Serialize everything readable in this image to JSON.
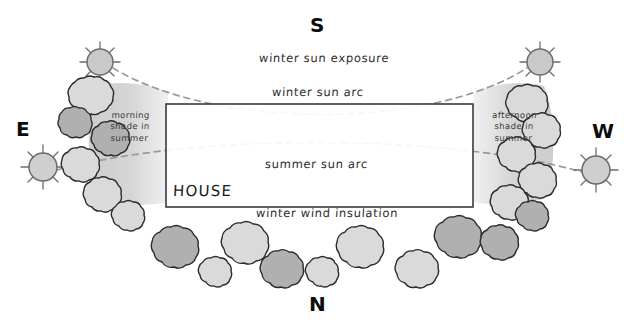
{
  "diagram": {
    "title_hidden": "Passive solar landscaping site plan",
    "compass": {
      "south": "S",
      "east": "E",
      "west": "W",
      "north": "N"
    },
    "labels": {
      "winter_sun_exposure": "winter sun exposure",
      "winter_sun_arc": "winter sun arc",
      "summer_sun_arc": "summer sun arc",
      "winter_wind_insulation": "winter wind insulation",
      "morning_shade": "morning\nshade in\nsummer",
      "morning_shade_line1": "morning",
      "morning_shade_line2": "shade in",
      "morning_shade_line3": "summer",
      "afternoon_shade_line1": "afternoon",
      "afternoon_shade_line2": "shade in",
      "afternoon_shade_line3": "summer",
      "house": "HOUSE"
    },
    "colors": {
      "background": "#ffffff",
      "outline": "#2b2b2b",
      "sun_fill": "#c9c9c9",
      "shrub_light": "#dadada",
      "shrub_medium": "#b0b0b0",
      "shade_fill": "#cfcfcf",
      "arc_dash": "#9a9a9a",
      "house_border": "#3a3a3a",
      "house_fill": "#ffffff",
      "compass_text": "#0d0d0d"
    },
    "house": {
      "x": 166,
      "y": 104,
      "width": 307,
      "height": 103
    },
    "suns": [
      {
        "name": "winter-sunrise-sun",
        "cx": 100,
        "cy": 62,
        "r": 13,
        "rays": 8
      },
      {
        "name": "winter-sunset-sun",
        "cx": 540,
        "cy": 62,
        "r": 13,
        "rays": 8
      },
      {
        "name": "summer-sunrise-sun",
        "cx": 43,
        "cy": 167,
        "r": 14,
        "rays": 8
      },
      {
        "name": "summer-sunset-sun",
        "cx": 596,
        "cy": 170,
        "r": 14,
        "rays": 8
      }
    ],
    "arcs": [
      {
        "name": "winter-sun-arc",
        "from": [
          113,
          68
        ],
        "to": [
          527,
          68
        ],
        "sag_y": 113
      },
      {
        "name": "summer-sun-arc",
        "from": [
          57,
          170
        ],
        "to": [
          582,
          172
        ],
        "peak_y": 150
      }
    ]
  }
}
